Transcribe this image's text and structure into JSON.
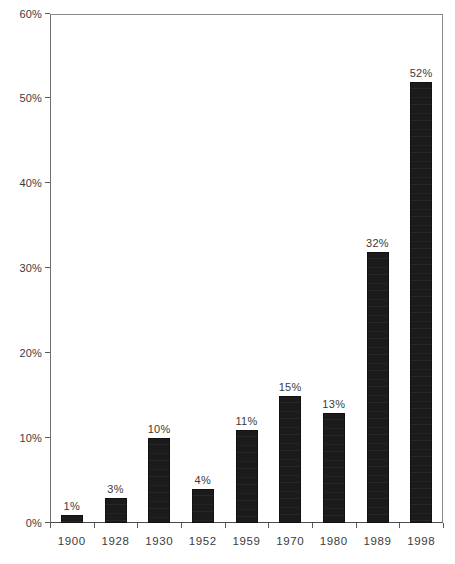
{
  "chart_data": {
    "type": "bar",
    "title": "",
    "subtitle": "",
    "xlabel": "",
    "ylabel": "",
    "categories": [
      "1900",
      "1928",
      "1930",
      "1952",
      "1959",
      "1970",
      "1980",
      "1989",
      "1998"
    ],
    "values": [
      1,
      3,
      10,
      4,
      11,
      15,
      13,
      32,
      52
    ],
    "value_labels": [
      "1%",
      "3%",
      "10%",
      "4%",
      "11%",
      "15%",
      "13%",
      "32%",
      "52%"
    ],
    "ylim": [
      0,
      60
    ],
    "ytick_values": [
      0,
      10,
      20,
      30,
      40,
      50,
      60
    ],
    "ytick_labels": [
      "0%",
      "10%",
      "20%",
      "30%",
      "40%",
      "50%",
      "60%"
    ],
    "grid": false,
    "legend": null,
    "legend_position": "none",
    "series": [
      {
        "name": "",
        "values": [
          1,
          3,
          10,
          4,
          11,
          15,
          13,
          32,
          52
        ]
      }
    ],
    "annotations": [],
    "colors": {
      "bar_fill": "#1b1b1b",
      "axis_line": "#5a5a5a",
      "plot_border": "#8a8a8a",
      "text": "#3b3b3b",
      "background": "#ffffff"
    }
  }
}
